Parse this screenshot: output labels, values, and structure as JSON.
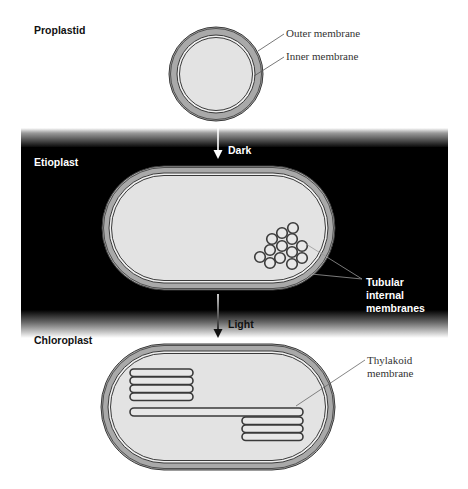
{
  "stages": {
    "proplastid": {
      "title": "Proplastid"
    },
    "etioplast": {
      "title": "Etioplast"
    },
    "chloroplast": {
      "title": "Chloroplast"
    }
  },
  "transitions": {
    "dark": {
      "label": "Dark"
    },
    "light": {
      "label": "Light"
    }
  },
  "annotations": {
    "outer_membrane": "Outer membrane",
    "inner_membrane": "Inner membrane",
    "tubular_line1": "Tubular",
    "tubular_line2": "internal",
    "tubular_line3": "membranes",
    "thylakoid_line1": "Thylakoid",
    "thylakoid_line2": "membrane"
  },
  "colors": {
    "background": "#ffffff",
    "dark_band": "#000000",
    "membrane_band": "#a9a9a9",
    "membrane_line": "#3a3a3a",
    "stroma": "#e3e3e3",
    "thylakoid_fill": "#e6e6e6"
  },
  "etioplast_tubules": [
    [
      293,
      228
    ],
    [
      282,
      233
    ],
    [
      292,
      239
    ],
    [
      272,
      239
    ],
    [
      282,
      246
    ],
    [
      302,
      246
    ],
    [
      270,
      250
    ],
    [
      292,
      252
    ],
    [
      260,
      257
    ],
    [
      280,
      258
    ],
    [
      302,
      258
    ],
    [
      270,
      263
    ],
    [
      292,
      264
    ]
  ]
}
